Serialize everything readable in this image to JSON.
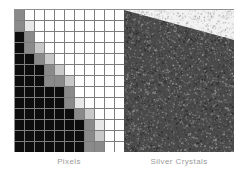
{
  "figure": {
    "background_color": "#ffffff",
    "panels": [
      {
        "name": "pixels",
        "caption": "Pixels",
        "type": "pixel-grid",
        "columns": 11,
        "rows": 13,
        "grid_line_color": "#7d7d7d",
        "palette": {
          "black": "#0d0d0d",
          "dark": "#3a3a3a",
          "mid": "#8a8a8a",
          "light": "#c9c9c9",
          "pale": "#e8e8e8",
          "white": "#ffffff"
        },
        "cells": [
          [
            "mid",
            "white",
            "white",
            "white",
            "white",
            "white",
            "white",
            "white",
            "white",
            "white",
            "white"
          ],
          [
            "mid",
            "pale",
            "white",
            "white",
            "white",
            "white",
            "white",
            "white",
            "white",
            "white",
            "white"
          ],
          [
            "black",
            "mid",
            "white",
            "white",
            "white",
            "white",
            "white",
            "white",
            "white",
            "white",
            "white"
          ],
          [
            "black",
            "mid",
            "light",
            "white",
            "white",
            "white",
            "white",
            "white",
            "white",
            "white",
            "white"
          ],
          [
            "black",
            "black",
            "mid",
            "light",
            "white",
            "white",
            "white",
            "white",
            "white",
            "white",
            "white"
          ],
          [
            "black",
            "black",
            "black",
            "mid",
            "light",
            "white",
            "white",
            "white",
            "white",
            "white",
            "white"
          ],
          [
            "black",
            "black",
            "black",
            "mid",
            "mid",
            "light",
            "white",
            "white",
            "white",
            "white",
            "white"
          ],
          [
            "black",
            "black",
            "black",
            "black",
            "black",
            "mid",
            "white",
            "white",
            "white",
            "white",
            "white"
          ],
          [
            "black",
            "black",
            "black",
            "black",
            "black",
            "mid",
            "pale",
            "white",
            "white",
            "white",
            "white"
          ],
          [
            "black",
            "black",
            "black",
            "black",
            "black",
            "black",
            "mid",
            "light",
            "white",
            "white",
            "white"
          ],
          [
            "black",
            "black",
            "black",
            "black",
            "black",
            "black",
            "black",
            "mid",
            "pale",
            "white",
            "white"
          ],
          [
            "black",
            "black",
            "black",
            "black",
            "black",
            "black",
            "black",
            "mid",
            "light",
            "white",
            "white"
          ],
          [
            "black",
            "black",
            "black",
            "black",
            "black",
            "black",
            "black",
            "mid",
            "mid",
            "white",
            "white"
          ]
        ]
      },
      {
        "name": "silver-crystals",
        "caption": "Silver Crystals",
        "type": "grain-noise",
        "dark_region_color": "#4a4a4a",
        "light_region_color": "#f2f2f2",
        "grain_description": "random silver halide grain with soft diagonal edge from upper-left to lower-right"
      }
    ]
  },
  "captions": {
    "left": "Pixels",
    "right": "Silver Crystals",
    "color": "#9a9a9a"
  }
}
